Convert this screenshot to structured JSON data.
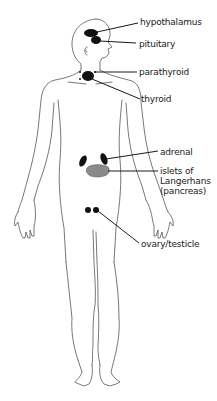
{
  "diagram": {
    "colors": {
      "outline": "#555555",
      "gland": "#111111",
      "pancreas": "#8a8a8a",
      "leader": "#1a1a1a",
      "text": "#1a1a1a",
      "background": "#ffffff"
    },
    "labels": [
      {
        "id": "hypothalamus",
        "text": "hypothalamus"
      },
      {
        "id": "pituitary",
        "text": "pituitary"
      },
      {
        "id": "parathyroid",
        "text": "parathyroid"
      },
      {
        "id": "thyroid",
        "text": "thyroid"
      },
      {
        "id": "adrenal",
        "text": "adrenal"
      },
      {
        "id": "islets",
        "text": "islets of\nLangerhans\n(pancreas)"
      },
      {
        "id": "ovary-testicle",
        "text": "ovary/testicle"
      }
    ]
  }
}
